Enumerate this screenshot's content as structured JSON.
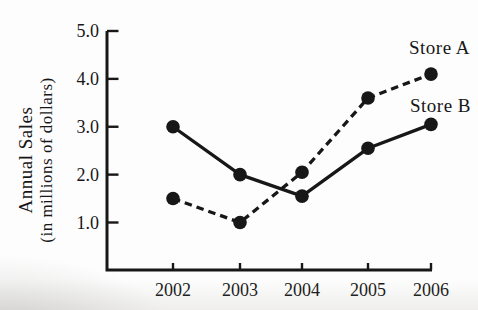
{
  "figure": {
    "ink_color": "#171717",
    "background_color": "#fdfdfd"
  },
  "chart_data": {
    "type": "line",
    "title": "",
    "xlabel": "",
    "ylabel": "Annual Sales (in millions of dollars)",
    "ylabel_line1": "Annual Sales",
    "ylabel_line2": "(in millions of dollars)",
    "categories": [
      "2002",
      "2003",
      "2004",
      "2005",
      "2006"
    ],
    "y_ticks": [
      5.0,
      4.0,
      3.0,
      2.0,
      1.0
    ],
    "y_tick_labels": [
      "5.0",
      "4.0",
      "3.0",
      "2.0",
      "1.0"
    ],
    "ylim": [
      0,
      5.0
    ],
    "grid": false,
    "legend_position": "inline labels at right ends of lines",
    "series": [
      {
        "name": "Store A",
        "line_style": "dashed",
        "marker": "filled-circle",
        "color": "#171717",
        "values": [
          1.5,
          1.0,
          2.05,
          3.6,
          4.1
        ]
      },
      {
        "name": "Store B",
        "line_style": "solid",
        "marker": "filled-circle",
        "color": "#171717",
        "values": [
          3.0,
          2.0,
          1.55,
          2.55,
          3.05
        ]
      }
    ]
  }
}
